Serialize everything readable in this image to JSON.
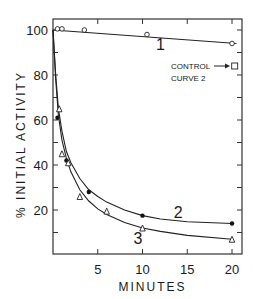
{
  "chart_data": {
    "type": "scatter",
    "title": "",
    "xlabel": "MINUTES",
    "ylabel": "% INITIAL ACTIVITY",
    "xlim": [
      0,
      21
    ],
    "ylim": [
      0,
      105
    ],
    "x_ticks": [
      5,
      10,
      15,
      20
    ],
    "x_tick_labels": [
      "5",
      "10",
      "15",
      "20"
    ],
    "y_ticks": [
      20,
      40,
      60,
      80,
      100
    ],
    "y_tick_labels": [
      "20",
      "40",
      "60",
      "80",
      "100"
    ],
    "grid": false,
    "series": [
      {
        "name": "1",
        "marker": "open-circle",
        "points": [
          [
            0.5,
            100.5
          ],
          [
            1,
            100.5
          ],
          [
            3.5,
            100
          ],
          [
            10.5,
            98
          ],
          [
            20,
            94
          ]
        ],
        "fit_line": [
          [
            0,
            100
          ],
          [
            20.5,
            94
          ]
        ]
      },
      {
        "name": "2",
        "marker": "filled-circle",
        "points": [
          [
            0.5,
            61
          ],
          [
            1.5,
            42
          ],
          [
            4,
            28
          ],
          [
            10,
            17.5
          ],
          [
            20,
            14
          ]
        ],
        "fit_line": [
          [
            0,
            100
          ],
          [
            0.3,
            80
          ],
          [
            0.6,
            65
          ],
          [
            1,
            55
          ],
          [
            1.5,
            46
          ],
          [
            2,
            41
          ],
          [
            3,
            34
          ],
          [
            4,
            29
          ],
          [
            5,
            26
          ],
          [
            6,
            23.5
          ],
          [
            8,
            20
          ],
          [
            10,
            17.5
          ],
          [
            12,
            16
          ],
          [
            15,
            14.8
          ],
          [
            20,
            14
          ]
        ]
      },
      {
        "name": "3",
        "marker": "open-triangle",
        "points": [
          [
            0.7,
            65
          ],
          [
            1,
            45
          ],
          [
            1.7,
            41
          ],
          [
            3,
            26
          ],
          [
            6,
            19.5
          ],
          [
            10,
            12
          ],
          [
            20,
            7
          ]
        ],
        "fit_line": [
          [
            0,
            100
          ],
          [
            0.3,
            78
          ],
          [
            0.6,
            62
          ],
          [
            1,
            51
          ],
          [
            1.5,
            43
          ],
          [
            2,
            37
          ],
          [
            3,
            29
          ],
          [
            4,
            24
          ],
          [
            5,
            20.5
          ],
          [
            6,
            18
          ],
          [
            8,
            14.5
          ],
          [
            10,
            12
          ],
          [
            12,
            10.5
          ],
          [
            15,
            8.7
          ],
          [
            20,
            7
          ]
        ]
      }
    ],
    "annotations": [
      {
        "text": "CONTROL",
        "line2": "CURVE 2",
        "arrow_to": "open-square",
        "point": [
          20.3,
          84
        ]
      }
    ],
    "curve_labels": [
      {
        "text": "1",
        "at": [
          12,
          91
        ]
      },
      {
        "text": "2",
        "at": [
          14,
          16.5
        ]
      },
      {
        "text": "3",
        "at": [
          9.5,
          5
        ]
      }
    ]
  }
}
